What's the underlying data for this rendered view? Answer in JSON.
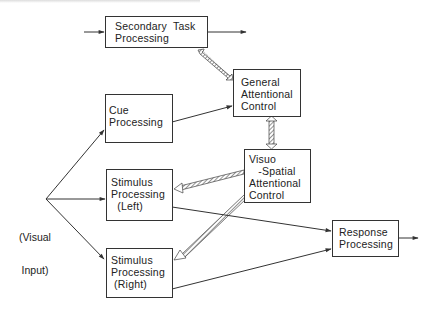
{
  "diagram": {
    "nodes": [
      {
        "id": "secondary",
        "lines": [
          "Secondary  Task",
          "Processing"
        ]
      },
      {
        "id": "cue",
        "lines": [
          "Cue",
          "Processing"
        ]
      },
      {
        "id": "general",
        "lines": [
          "General",
          "Attentional",
          "Control"
        ]
      },
      {
        "id": "visuospatial",
        "lines": [
          "Visuo",
          "   -Spatial",
          "Attentional",
          "Control"
        ]
      },
      {
        "id": "stim_left",
        "lines": [
          "Stimulus",
          "Processing",
          "  (Left)"
        ]
      },
      {
        "id": "stim_right",
        "lines": [
          "Stimulus",
          "Processing",
          " (Right)"
        ]
      },
      {
        "id": "response",
        "lines": [
          "Response",
          "Processing"
        ]
      }
    ],
    "input_label": {
      "lines": [
        "(Visual",
        "Input)"
      ]
    },
    "edges": [
      {
        "from": "external",
        "to": "secondary",
        "style": "arrow"
      },
      {
        "from": "secondary",
        "to": "external",
        "style": "arrow"
      },
      {
        "from": "secondary",
        "to": "general",
        "style": "hatched-bidirectional"
      },
      {
        "from": "cue",
        "to": "general",
        "style": "arrow"
      },
      {
        "from": "general",
        "to": "visuospatial",
        "style": "hatched-bidirectional"
      },
      {
        "from": "visuospatial",
        "to": "stim_left",
        "style": "hatched"
      },
      {
        "from": "visuospatial",
        "to": "stim_right",
        "style": "hatched"
      },
      {
        "from": "visual_input",
        "to": "cue",
        "style": "arrow"
      },
      {
        "from": "visual_input",
        "to": "stim_left",
        "style": "arrow"
      },
      {
        "from": "visual_input",
        "to": "stim_right",
        "style": "arrow"
      },
      {
        "from": "stim_left",
        "to": "response",
        "style": "arrow"
      },
      {
        "from": "stim_right",
        "to": "response",
        "style": "arrow"
      },
      {
        "from": "response",
        "to": "external",
        "style": "arrow"
      }
    ],
    "colors": {
      "line": "#333333",
      "text": "#222222",
      "background": "#ffffff"
    }
  }
}
